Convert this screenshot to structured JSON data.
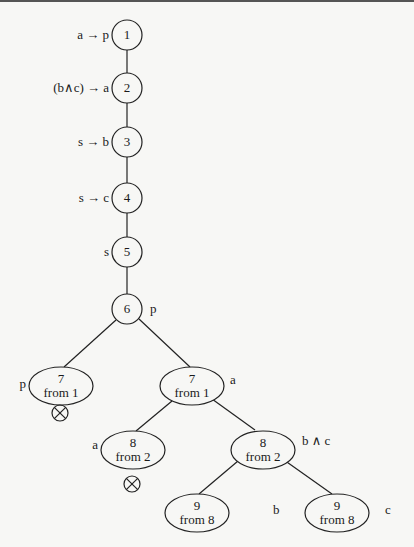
{
  "diagram": {
    "type": "tableau-proof-tree",
    "nodes": [
      {
        "id": "n1",
        "number": "1",
        "sub": "",
        "label": "a → p",
        "label_side": "left"
      },
      {
        "id": "n2",
        "number": "2",
        "sub": "",
        "label": "(b∧c) → a",
        "label_side": "left"
      },
      {
        "id": "n3",
        "number": "3",
        "sub": "",
        "label": "s → b",
        "label_side": "left"
      },
      {
        "id": "n4",
        "number": "4",
        "sub": "",
        "label": "s → c",
        "label_side": "left"
      },
      {
        "id": "n5",
        "number": "5",
        "sub": "",
        "label": "s",
        "label_side": "left"
      },
      {
        "id": "n6",
        "number": "6",
        "sub": "",
        "label": "p",
        "label_side": "right"
      },
      {
        "id": "n7a",
        "number": "7",
        "sub": "from 1",
        "label": "p",
        "label_side": "left",
        "closed": true
      },
      {
        "id": "n7b",
        "number": "7",
        "sub": "from 1",
        "label": "a",
        "label_side": "right"
      },
      {
        "id": "n8a",
        "number": "8",
        "sub": "from 2",
        "label": "a",
        "label_side": "left",
        "closed": true
      },
      {
        "id": "n8b",
        "number": "8",
        "sub": "from 2",
        "label": "b ∧ c",
        "label_side": "right"
      },
      {
        "id": "n9a",
        "number": "9",
        "sub": "from 8",
        "label": "b",
        "label_side": "right"
      },
      {
        "id": "n9b",
        "number": "9",
        "sub": "from 8",
        "label": "c",
        "label_side": "right"
      }
    ],
    "edges": [
      [
        "n1",
        "n2"
      ],
      [
        "n2",
        "n3"
      ],
      [
        "n3",
        "n4"
      ],
      [
        "n4",
        "n5"
      ],
      [
        "n5",
        "n6"
      ],
      [
        "n6",
        "n7a"
      ],
      [
        "n6",
        "n7b"
      ],
      [
        "n7b",
        "n8a"
      ],
      [
        "n7b",
        "n8b"
      ],
      [
        "n8b",
        "n9a"
      ],
      [
        "n8b",
        "n9b"
      ]
    ],
    "closed_marker": "⊗"
  }
}
